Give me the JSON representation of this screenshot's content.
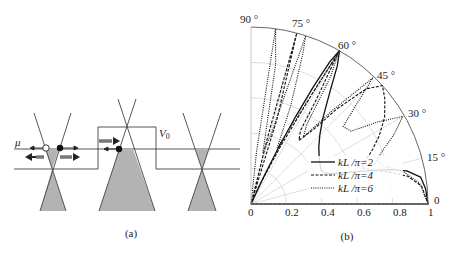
{
  "panel_a": {
    "caption": "(a)",
    "mu_label": "μ",
    "v0_label": "V",
    "v0_sub": "0",
    "colors": {
      "line": "#333333",
      "fill": "#b3b3b3"
    }
  },
  "panel_b": {
    "caption": "(b)",
    "angle_labels": [
      "90 °",
      "75 °",
      "60 °",
      "45 °",
      "30 °",
      "15 °",
      "0"
    ],
    "radial_labels": [
      "0",
      "0.2",
      "0.4",
      "0.6",
      "0.8",
      "1"
    ],
    "legend": [
      {
        "label": "kL /π=2",
        "style": "solid"
      },
      {
        "label": "kL /π=4",
        "style": "dashed"
      },
      {
        "label": "kL /π=6",
        "style": "dotted"
      }
    ]
  },
  "chart_data": {
    "type": "line",
    "subtype": "polar",
    "title": "",
    "theta_unit": "deg",
    "theta_ticks": [
      0,
      15,
      30,
      45,
      60,
      75,
      90
    ],
    "r_ticks": [
      0,
      0.2,
      0.4,
      0.6,
      0.8,
      1
    ],
    "rlim": [
      0,
      1
    ],
    "thetalim": [
      0,
      90
    ],
    "grid": true,
    "legend_position": "inside lower center",
    "series": [
      {
        "name": "kL/π=2",
        "style": "solid",
        "points": [
          [
            0,
            1.0
          ],
          [
            5,
            0.99
          ],
          [
            9,
            0.97
          ],
          [
            12,
            0.9
          ],
          [
            14,
            0.8
          ],
          [
            16,
            0.68
          ],
          [
            18,
            0.58
          ],
          [
            20,
            0.5
          ],
          [
            23,
            0.45
          ],
          [
            26,
            0.44
          ],
          [
            30,
            0.45
          ],
          [
            35,
            0.47
          ],
          [
            40,
            0.5
          ],
          [
            45,
            0.55
          ],
          [
            50,
            0.63
          ],
          [
            55,
            0.78
          ],
          [
            58,
            0.92
          ],
          [
            60,
            1.0
          ],
          [
            61,
            0.92
          ],
          [
            62,
            0.75
          ],
          [
            63,
            0.55
          ],
          [
            64,
            0.35
          ],
          [
            65,
            0.15
          ],
          [
            66,
            0.0
          ]
        ]
      },
      {
        "name": "kL/π=4",
        "style": "dashed",
        "points": [
          [
            0,
            1.0
          ],
          [
            6,
            0.97
          ],
          [
            10,
            0.9
          ],
          [
            13,
            0.8
          ],
          [
            16,
            0.7
          ],
          [
            18,
            0.66
          ],
          [
            20,
            0.68
          ],
          [
            24,
            0.75
          ],
          [
            28,
            0.82
          ],
          [
            33,
            0.9
          ],
          [
            38,
            0.96
          ],
          [
            42,
            1.0
          ],
          [
            45,
            0.92
          ],
          [
            48,
            0.72
          ],
          [
            50,
            0.55
          ],
          [
            53,
            0.45
          ],
          [
            56,
            0.5
          ],
          [
            58,
            0.7
          ],
          [
            60,
            0.98
          ],
          [
            61,
            0.7
          ],
          [
            63,
            0.35
          ],
          [
            66,
            0.1
          ],
          [
            70,
            0.0
          ],
          [
            73,
            0.5
          ],
          [
            75,
            1.0
          ],
          [
            76,
            0.4
          ],
          [
            78,
            0.0
          ]
        ]
      },
      {
        "name": "kL/π=6",
        "style": "dotted",
        "points": [
          [
            0,
            1.0
          ],
          [
            7,
            0.96
          ],
          [
            12,
            0.88
          ],
          [
            16,
            0.78
          ],
          [
            19,
            0.75
          ],
          [
            22,
            0.8
          ],
          [
            26,
            0.9
          ],
          [
            30,
            0.99
          ],
          [
            33,
            0.85
          ],
          [
            36,
            0.7
          ],
          [
            40,
            0.68
          ],
          [
            43,
            0.8
          ],
          [
            46,
            0.99
          ],
          [
            49,
            0.7
          ],
          [
            52,
            0.48
          ],
          [
            55,
            0.55
          ],
          [
            58,
            0.85
          ],
          [
            60,
            0.99
          ],
          [
            62,
            0.55
          ],
          [
            65,
            0.35
          ],
          [
            68,
            0.6
          ],
          [
            71,
            0.9
          ],
          [
            72,
            1.0
          ],
          [
            74,
            0.4
          ],
          [
            77,
            0.3
          ],
          [
            80,
            0.8
          ],
          [
            82,
            1.0
          ],
          [
            84,
            0.3
          ],
          [
            86,
            0.0
          ]
        ]
      }
    ]
  }
}
